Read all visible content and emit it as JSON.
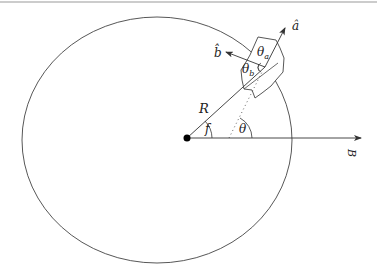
{
  "diagram": {
    "labels": {
      "a_hat": "â",
      "b_hat": "b̂",
      "theta_a": "θ",
      "theta_a_sub": "a",
      "theta_b": "θ",
      "theta_b_sub": "b",
      "radius": "R",
      "true_anomaly": "f",
      "theta": "θ",
      "field": "B"
    },
    "colors": {
      "stroke": "#333333",
      "dot": "#000000",
      "border": "#999999"
    }
  }
}
